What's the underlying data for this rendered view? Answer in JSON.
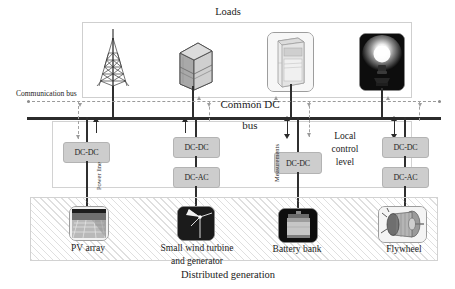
{
  "diagram": {
    "title_top": "Loads",
    "title_bottom": "Distributed generation",
    "bus_label_line1": "Common DC",
    "bus_label_line2": "bus",
    "communication_bus_label": "Communication bus",
    "power_line_label": "Power line",
    "measurements_label": "Measurements",
    "local_control_label_line1": "Local",
    "local_control_label_line2": "control",
    "local_control_label_line3": "level",
    "colors": {
      "bus": "#2b2b2b",
      "converter_fill": "#cdcdcd",
      "converter_border": "#b3b3b3",
      "frame_border": "#d0d0d0",
      "comm_bus": "#9a9a9a",
      "text": "#1b1b1b"
    }
  },
  "loads": [
    {
      "name": "telecom-tower",
      "icon": "antenna-tower-icon",
      "x": 113
    },
    {
      "name": "server-rack",
      "icon": "server-cabinet-icon",
      "x": 193
    },
    {
      "name": "air-conditioner",
      "icon": "air-conditioner-icon",
      "x": 291
    },
    {
      "name": "light-bulb",
      "icon": "light-bulb-icon",
      "x": 381
    }
  ],
  "sources": [
    {
      "label": "PV array",
      "icon": "pv-array-icon",
      "x": 100
    },
    {
      "label": "Small wind turbine",
      "label2": "and generator",
      "icon": "wind-turbine-icon",
      "x": 197
    },
    {
      "label": "Battery bank",
      "icon": "battery-bank-icon",
      "x": 297
    },
    {
      "label": "Flywheel",
      "icon": "flywheel-icon",
      "x": 402
    }
  ],
  "converters": [
    {
      "id": "pv-dcdc",
      "label": "DC-DC",
      "x": 86,
      "y": 142
    },
    {
      "id": "wind-dcdc",
      "label": "DC-DC",
      "x": 195,
      "y": 137
    },
    {
      "id": "wind-dcac",
      "label": "DC-AC",
      "x": 195,
      "y": 167
    },
    {
      "id": "battery-dcdc",
      "label": "DC-DC",
      "x": 297,
      "y": 152
    },
    {
      "id": "flywheel-dcdc",
      "label": "DC-DC",
      "x": 404,
      "y": 137
    },
    {
      "id": "flywheel-dcac",
      "label": "DC-AC",
      "x": 404,
      "y": 167
    }
  ],
  "power_flow": [
    {
      "source": "pv-array",
      "direction": "up",
      "bidirectional": false
    },
    {
      "source": "wind-turbine",
      "direction": "up",
      "bidirectional": false
    },
    {
      "source": "battery-bank",
      "direction": "bidirectional",
      "bidirectional": true
    },
    {
      "source": "flywheel",
      "direction": "bidirectional",
      "bidirectional": true
    }
  ]
}
